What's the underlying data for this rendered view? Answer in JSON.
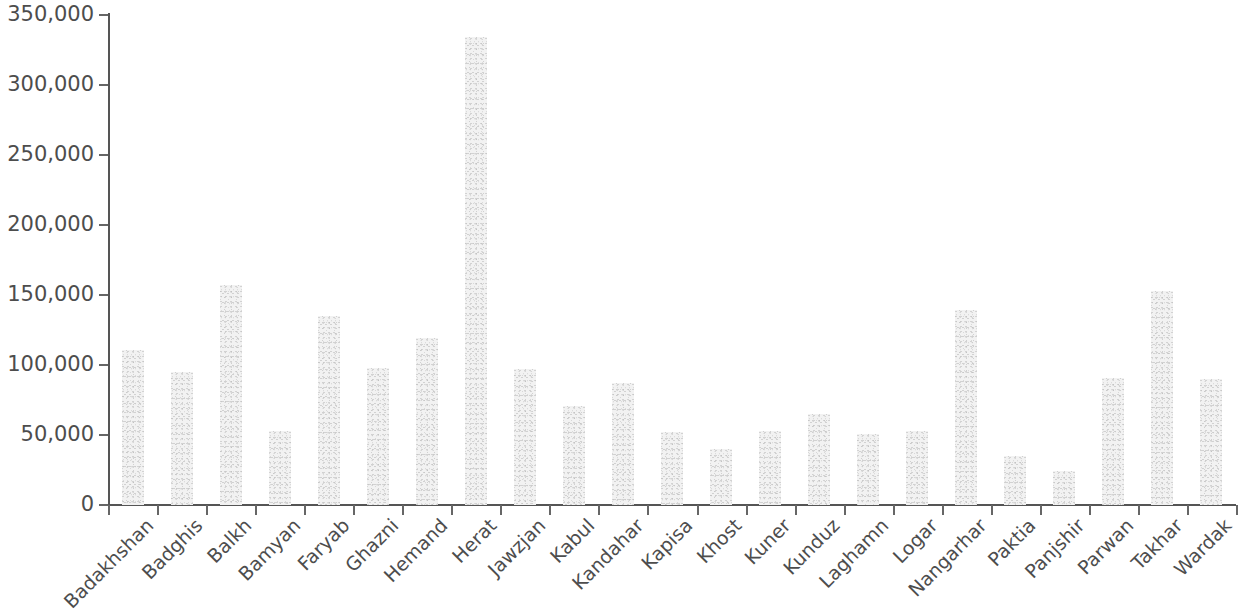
{
  "chart_data": {
    "type": "bar",
    "title": "",
    "subtitle": "",
    "xlabel": "",
    "ylabel": "",
    "ylim": [
      0,
      350000
    ],
    "y_ticks": [
      0,
      50000,
      100000,
      150000,
      200000,
      250000,
      300000,
      350000
    ],
    "y_tick_labels": [
      "0",
      "50,000",
      "100,000",
      "150,000",
      "200,000",
      "250,000",
      "300,000",
      "350,000"
    ],
    "grid": false,
    "legend": false,
    "legend_position": "none",
    "bar_color": "#f0f0f0",
    "axis_color": "#555555",
    "text_color": "#4d4d4d",
    "x_label_rotation": -45,
    "categories": [
      "Badakhshan",
      "Badghis",
      "Balkh",
      "Bamyan",
      "Faryab",
      "Ghazni",
      "Hemand",
      "Herat",
      "Jawzjan",
      "Kabul",
      "Kandahar",
      "Kapisa",
      "Khost",
      "Kuner",
      "Kunduz",
      "Laghamn",
      "Logar",
      "Nangarhar",
      "Paktia",
      "Panjshir",
      "Parwan",
      "Takhar",
      "Wardak"
    ],
    "values": [
      111000,
      95000,
      157000,
      53000,
      135000,
      98000,
      119000,
      334000,
      97000,
      71000,
      87000,
      52000,
      40000,
      53000,
      65000,
      51000,
      53000,
      139000,
      35000,
      24000,
      91000,
      153000,
      90000
    ]
  }
}
